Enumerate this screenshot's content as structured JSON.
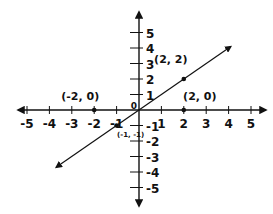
{
  "chart_data": {
    "type": "line",
    "title": "",
    "xlabel": "",
    "ylabel": "",
    "xlim": [
      -5,
      5
    ],
    "ylim": [
      -5,
      5
    ],
    "grid": false,
    "x_ticks": [
      "-5",
      "-4",
      "-3",
      "-2",
      "-1",
      "1",
      "2",
      "3",
      "4",
      "5"
    ],
    "y_ticks": [
      "5",
      "4",
      "3",
      "2",
      "1",
      "-1",
      "-2",
      "-3",
      "-4",
      "-5"
    ],
    "origin_label": "0",
    "series": [
      {
        "name": "line y = x",
        "x": [
          -3.7,
          4.1
        ],
        "y": [
          -3.7,
          4.1
        ]
      }
    ],
    "points": [
      {
        "x": -2,
        "y": 0,
        "label": "(-2, 0)"
      },
      {
        "x": 2,
        "y": 0,
        "label": "(2, 0)"
      },
      {
        "x": 2,
        "y": 2,
        "label": "(2, 2)"
      },
      {
        "x": -1,
        "y": -1,
        "label": "(-1, -1)"
      }
    ]
  }
}
